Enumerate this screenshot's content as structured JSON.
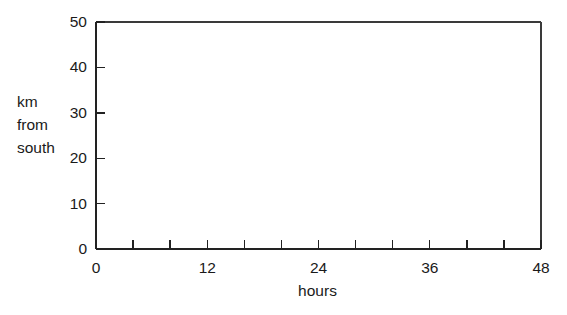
{
  "chart_data": {
    "type": "line",
    "title": "",
    "subtitle": "",
    "xlabel": "hours",
    "ylabel": "km from south",
    "ylabel_lines": [
      "km",
      "from",
      "south"
    ],
    "xlim": [
      0,
      48
    ],
    "ylim": [
      0,
      50
    ],
    "x_tick_values": [
      0,
      4,
      8,
      12,
      16,
      20,
      24,
      28,
      32,
      36,
      40,
      44,
      48
    ],
    "x_tick_labels": [
      {
        "value": 0,
        "label": "0"
      },
      {
        "value": 12,
        "label": "12"
      },
      {
        "value": 24,
        "label": "24"
      },
      {
        "value": 36,
        "label": "36"
      },
      {
        "value": 48,
        "label": "48"
      }
    ],
    "y_tick_values": [
      0,
      10,
      20,
      30,
      40,
      50
    ],
    "y_tick_labels": [
      {
        "value": 0,
        "label": "0"
      },
      {
        "value": 10,
        "label": "10"
      },
      {
        "value": 20,
        "label": "20"
      },
      {
        "value": 30,
        "label": "30"
      },
      {
        "value": 40,
        "label": "40"
      },
      {
        "value": 50,
        "label": "50"
      }
    ],
    "series": [],
    "values": [],
    "categories": [],
    "grid": false,
    "legend": null,
    "annotations": [],
    "frame": "box",
    "tick_direction": "in",
    "colors": {
      "axis": "#222222",
      "frame": "#3a3a3a",
      "text": "#1a1a1a",
      "background": "#ffffff"
    }
  },
  "figure": {
    "width": 567,
    "height": 315,
    "plot_area": {
      "left": 96,
      "right": 541,
      "top": 22,
      "bottom": 249
    }
  }
}
